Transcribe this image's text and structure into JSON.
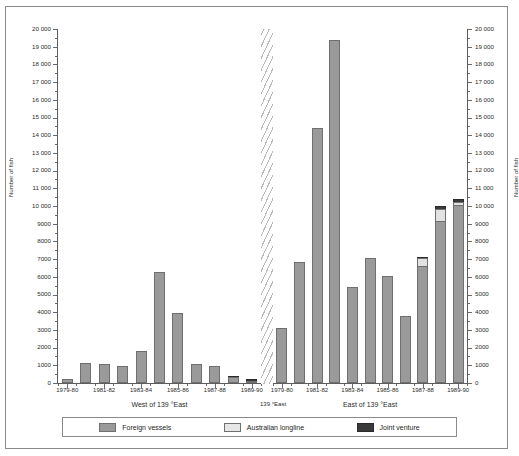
{
  "chart_data": {
    "type": "bar",
    "title": "",
    "subtitle": "",
    "xlabel": "",
    "ylabel": "Number of fish",
    "ylabel_right": "Number of fish",
    "ylim": [
      0,
      20000
    ],
    "ytick_step": 1000,
    "grid": false,
    "stacked": true,
    "legend_position": "bottom",
    "ytick_labels": [
      "0",
      "1000",
      "2000",
      "3000",
      "4000",
      "5000",
      "6000",
      "7000",
      "8000",
      "9000",
      "10 000",
      "11 000",
      "12 000",
      "13 000",
      "14 000",
      "15 000",
      "16 000",
      "17 000",
      "18 000",
      "19 000",
      "20 000"
    ],
    "legend": [
      {
        "name": "Foreign vessels",
        "color": "#9a9a9a"
      },
      {
        "name": "Australian longline",
        "color": "#e6e6e6"
      },
      {
        "name": "Joint venture",
        "color": "#3a3a3a"
      }
    ],
    "panels": [
      {
        "caption": "West of 139 °East",
        "categories": [
          "1979-80",
          "1980-81",
          "1981-82",
          "1982-83",
          "1983-84",
          "1984-85",
          "1985-86",
          "1986-87",
          "1987-88",
          "1988-89",
          "1989-90"
        ],
        "tick_labels": [
          "1979-80",
          "",
          "1981-82",
          "",
          "1983-84",
          "",
          "1985-86",
          "",
          "1987-88",
          "",
          "1989-90"
        ],
        "series": [
          {
            "name": "Foreign vessels",
            "values": [
              200,
              1150,
              1050,
              950,
              1800,
              6250,
              3950,
              1050,
              980,
              330,
              140
            ]
          },
          {
            "name": "Australian longline",
            "values": [
              0,
              0,
              0,
              0,
              0,
              0,
              0,
              0,
              0,
              0,
              0
            ]
          },
          {
            "name": "Joint venture",
            "values": [
              0,
              0,
              0,
              0,
              0,
              0,
              0,
              0,
              0,
              60,
              30
            ]
          }
        ]
      },
      {
        "caption": "East of 139 °East",
        "categories": [
          "1979-80",
          "1980-81",
          "1981-82",
          "1982-83",
          "1983-84",
          "1984-85",
          "1985-86",
          "1986-87",
          "1987-88",
          "1988-89",
          "1989-90"
        ],
        "tick_labels": [
          "1979-80",
          "",
          "1981-82",
          "",
          "1983-84",
          "",
          "1985-86",
          "",
          "1987-88",
          "",
          "1989-90"
        ],
        "series": [
          {
            "name": "Foreign vessels",
            "values": [
              3100,
              6850,
              14400,
              19400,
              5400,
              7050,
              6050,
              3800,
              6600,
              9150,
              10050
            ]
          },
          {
            "name": "Australian longline",
            "values": [
              0,
              0,
              0,
              0,
              0,
              0,
              0,
              0,
              450,
              700,
              200
            ]
          },
          {
            "name": "Joint venture",
            "values": [
              0,
              0,
              0,
              0,
              0,
              0,
              0,
              0,
              80,
              150,
              170
            ]
          }
        ]
      }
    ],
    "divider_label": "139 °East"
  }
}
